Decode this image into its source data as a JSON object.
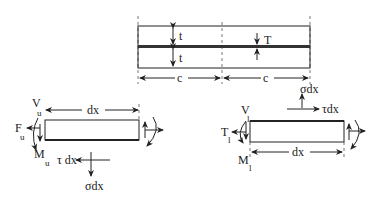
{
  "figure": {
    "top_assembly": {
      "adherend_thickness_label": "t",
      "adhesive_thickness_label": "T",
      "half_length_label": "c"
    },
    "upper_element": {
      "shear_label": "V",
      "shear_sub": "u",
      "axial_label": "F",
      "axial_sub": "u",
      "moment_label": "M",
      "moment_sub": "u",
      "length_label": "dx",
      "shear_stress_label": "τ dx",
      "normal_stress_label": "σdx"
    },
    "lower_element": {
      "shear_label": "V",
      "shear_sub": "l",
      "axial_label": "T",
      "axial_sub": "l",
      "moment_label": "M",
      "moment_sub": "l",
      "length_label": "dx",
      "shear_stress_label": "τdx",
      "normal_stress_label": "σdx"
    }
  }
}
